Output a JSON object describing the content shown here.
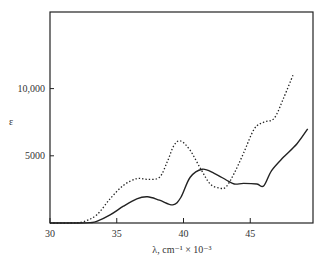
{
  "chart_data": {
    "type": "line",
    "title": "",
    "xlabel": "λ, cm⁻¹ × 10⁻³",
    "ylabel": "ε",
    "xlim": [
      30,
      49.7
    ],
    "ylim": [
      0,
      15700
    ],
    "grid": false,
    "legend": null,
    "x_ticks": [
      30,
      35,
      40,
      45
    ],
    "x_tick_labels": [
      "30",
      "35",
      "40",
      "45"
    ],
    "y_ticks": [
      5000,
      10000
    ],
    "y_tick_labels": [
      "5000",
      "10,000"
    ],
    "series": [
      {
        "name": "solid",
        "style": "solid",
        "x": [
          30,
          32,
          33,
          33.5,
          34.5,
          35.5,
          36.5,
          37.3,
          38.2,
          39.2,
          39.8,
          40.5,
          41.4,
          42.3,
          43.2,
          43.8,
          44.5,
          45.5,
          46.0,
          46.6,
          47.5,
          48.5,
          49.3
        ],
        "y": [
          0,
          0,
          30,
          120,
          600,
          1250,
          1800,
          1950,
          1700,
          1350,
          1900,
          3400,
          4000,
          3700,
          3200,
          2900,
          2950,
          2900,
          2750,
          3900,
          4900,
          5900,
          7000
        ]
      },
      {
        "name": "dotted",
        "style": "dotted",
        "x": [
          30,
          31.5,
          32.5,
          33.5,
          34.5,
          35.5,
          36.5,
          37.3,
          38.2,
          38.8,
          39.3,
          39.8,
          40.5,
          41.3,
          42.0,
          42.7,
          43.2,
          43.8,
          44.5,
          45.3,
          46.0,
          46.8,
          47.5,
          48.2
        ],
        "y": [
          0,
          0,
          100,
          600,
          1800,
          2800,
          3300,
          3250,
          3400,
          4600,
          5800,
          6100,
          5400,
          4000,
          2900,
          2600,
          2700,
          3700,
          5200,
          7000,
          7500,
          7800,
          9300,
          11000
        ]
      }
    ]
  },
  "axes": {
    "x_axis_label": "λ, cm⁻¹ × 10⁻³",
    "y_axis_label": "ε",
    "x_tick_labels": [
      "30",
      "35",
      "40",
      "45"
    ],
    "y_tick_labels": [
      "5000",
      "10,000"
    ]
  }
}
